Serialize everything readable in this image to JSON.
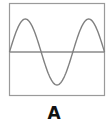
{
  "figure": {
    "label": "A",
    "frame_color": "#9a9a9a",
    "wave_color": "#808080",
    "axis_color": "#8a8a8a"
  },
  "chart_data": {
    "type": "line",
    "title": "",
    "caption": "A",
    "x_cycles": 1.5,
    "amplitude": 1,
    "grid": false
  }
}
